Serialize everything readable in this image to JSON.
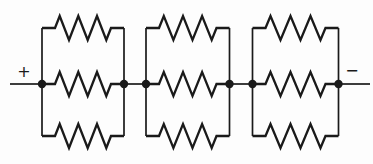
{
  "diagram": {
    "type": "circuit",
    "stroke_color": "#1a1a1a",
    "background_color": "#fdfdfd",
    "terminals": {
      "positive_label": "+",
      "negative_label": "−"
    },
    "groups": [
      {
        "label": "parallel-group-1",
        "resistor_count": 3
      },
      {
        "label": "parallel-group-2",
        "resistor_count": 3
      },
      {
        "label": "parallel-group-3",
        "resistor_count": 3
      }
    ],
    "junction_dot_count": 6
  }
}
